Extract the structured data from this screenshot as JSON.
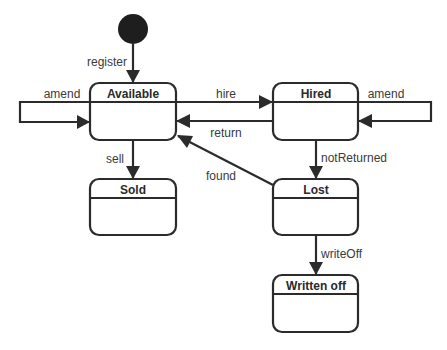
{
  "diagram": {
    "type": "uml-state-machine",
    "colors": {
      "line": "#2b2b2b",
      "initial_fill": "#1e1e1e",
      "state_fill": "#ffffff",
      "text": "#3a3a3a"
    },
    "initial": {
      "id": "initial"
    },
    "states": [
      {
        "id": "available",
        "label": "Available"
      },
      {
        "id": "hired",
        "label": "Hired"
      },
      {
        "id": "sold",
        "label": "Sold"
      },
      {
        "id": "lost",
        "label": "Lost"
      },
      {
        "id": "written_off",
        "label": "Written off"
      }
    ],
    "transitions": [
      {
        "id": "register",
        "from": "initial",
        "to": "available",
        "label": "register"
      },
      {
        "id": "amend_available",
        "from": "available",
        "to": "available",
        "label": "amend"
      },
      {
        "id": "hire",
        "from": "available",
        "to": "hired",
        "label": "hire"
      },
      {
        "id": "return",
        "from": "hired",
        "to": "available",
        "label": "return"
      },
      {
        "id": "amend_hired",
        "from": "hired",
        "to": "hired",
        "label": "amend"
      },
      {
        "id": "sell",
        "from": "available",
        "to": "sold",
        "label": "sell"
      },
      {
        "id": "notReturned",
        "from": "hired",
        "to": "lost",
        "label": "notReturned"
      },
      {
        "id": "found",
        "from": "lost",
        "to": "available",
        "label": "found"
      },
      {
        "id": "writeOff",
        "from": "lost",
        "to": "written_off",
        "label": "writeOff"
      }
    ]
  }
}
